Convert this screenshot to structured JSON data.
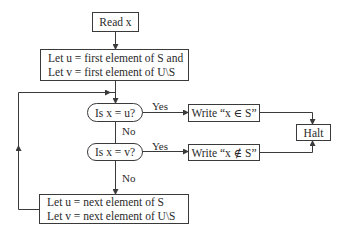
{
  "diagram": {
    "type": "flowchart",
    "title": "",
    "nodes": {
      "read": {
        "text": "Read x"
      },
      "init": {
        "line1": "Let u = first element of S and",
        "line2": "Let v = first element of U\\S"
      },
      "test_u": {
        "text": "Is x = u?"
      },
      "test_v": {
        "text": "Is x = v?"
      },
      "write_in": {
        "text": "Write “x ∈ S”"
      },
      "write_notin": {
        "text": "Write “x ∉ S”"
      },
      "halt": {
        "text": "Halt"
      },
      "next": {
        "line1": "Let u = next element of S",
        "line2": "Let v = next element of U\\S"
      }
    },
    "edge_labels": {
      "yes_u": "Yes",
      "no_u": "No",
      "yes_v": "Yes",
      "no_v": "No"
    },
    "edges": [
      {
        "from": "read",
        "to": "init"
      },
      {
        "from": "init",
        "to": "test_u"
      },
      {
        "from": "test_u",
        "to": "write_in",
        "label": "Yes"
      },
      {
        "from": "test_u",
        "to": "test_v",
        "label": "No"
      },
      {
        "from": "test_v",
        "to": "write_notin",
        "label": "Yes"
      },
      {
        "from": "test_v",
        "to": "next",
        "label": "No"
      },
      {
        "from": "write_in",
        "to": "halt"
      },
      {
        "from": "write_notin",
        "to": "halt"
      },
      {
        "from": "next",
        "to": "test_u",
        "label": ""
      }
    ],
    "colors": {
      "line": "#3a3a3a",
      "text": "#2a2a2a",
      "background": "#ffffff"
    }
  }
}
